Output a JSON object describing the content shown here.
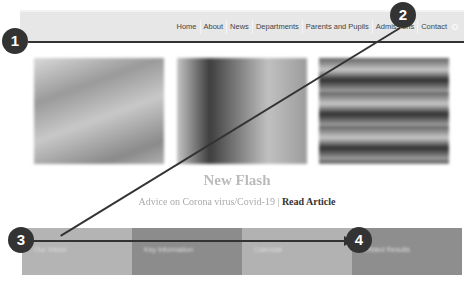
{
  "nav": {
    "items": [
      "Home",
      "About",
      "News",
      "Departments",
      "Parents and Pupils",
      "Admissions",
      "Contact"
    ],
    "search_icon": "search-icon"
  },
  "gallery": {
    "images": [
      "building-photo-1",
      "building-photo-2",
      "building-photo-3"
    ]
  },
  "news": {
    "headline": "New Flash",
    "text": "Advice on Corona virus/Covid-19 |",
    "link": "Read Article"
  },
  "tiles": [
    {
      "label": "Our Vision",
      "color": "#b4b4b4"
    },
    {
      "label": "Key Information",
      "color": "#8c8c8c"
    },
    {
      "label": "Calendar",
      "color": "#b2b2b2"
    },
    {
      "label": "Ofsted Results",
      "color": "#8e8e8e"
    }
  ],
  "annotations": {
    "badges": [
      "1",
      "2",
      "3",
      "4"
    ]
  }
}
